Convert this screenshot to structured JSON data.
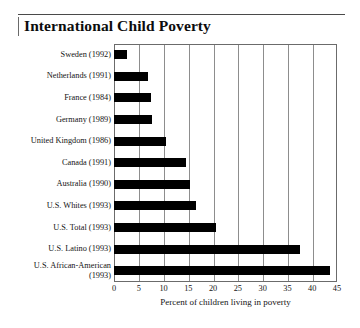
{
  "title": "International Child Poverty",
  "axis": {
    "xlabel": "Percent of children living in poverty",
    "ticks": [
      "0",
      "5",
      "10",
      "15",
      "20",
      "25",
      "30",
      "35",
      "40",
      "45"
    ]
  },
  "rows": [
    {
      "label": "Sweden (1992)",
      "value": 2.7
    },
    {
      "label": "Netherlands (1991)",
      "value": 6.8
    },
    {
      "label": "France (1984)",
      "value": 7.4
    },
    {
      "label": "Germany (1989)",
      "value": 7.6
    },
    {
      "label": "United Kingdom (1986)",
      "value": 10.5
    },
    {
      "label": "Canada (1991)",
      "value": 14.5
    },
    {
      "label": "Australia (1990)",
      "value": 15.4
    },
    {
      "label": "U.S. Whites (1993)",
      "value": 16.5
    },
    {
      "label": "U.S. Total (1993)",
      "value": 20.5
    },
    {
      "label": "U.S. Latino (1993)",
      "value": 37.5
    },
    {
      "label": "U.S. African-American\n(1993)",
      "value": 43.5
    }
  ],
  "chart_data": {
    "type": "bar",
    "orientation": "horizontal",
    "title": "International Child Poverty",
    "xlabel": "Percent of children living in poverty",
    "ylabel": "",
    "xlim": [
      0,
      45
    ],
    "xticks": [
      0,
      5,
      10,
      15,
      20,
      25,
      30,
      35,
      40,
      45
    ],
    "grid": "vertical",
    "legend": "none",
    "bar_color": "#000000",
    "categories": [
      "Sweden (1992)",
      "Netherlands (1991)",
      "France (1984)",
      "Germany (1989)",
      "United Kingdom (1986)",
      "Canada (1991)",
      "Australia (1990)",
      "U.S. Whites (1993)",
      "U.S. Total (1993)",
      "U.S. Latino (1993)",
      "U.S. African-American (1993)"
    ],
    "values": [
      2.7,
      6.8,
      7.4,
      7.6,
      10.5,
      14.5,
      15.4,
      16.5,
      20.5,
      37.5,
      43.5
    ]
  }
}
